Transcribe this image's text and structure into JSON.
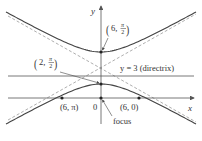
{
  "diagram": {
    "type": "conic-hyperbola-polar",
    "axes": {
      "x_label": "x",
      "y_label": "y",
      "origin_label": "0"
    },
    "labels": {
      "upper_vertex": "(6, π/2)",
      "lower_vertex": "(2, π/2)",
      "left_intercept": "(6, π)",
      "right_intercept": "(6, 0)",
      "directrix": "y = 3 (directrix)",
      "focus": "focus"
    },
    "fractions": {
      "pi": "π",
      "two": "2"
    },
    "points": [
      {
        "name": "upper-vertex",
        "polar": "(6, π/2)"
      },
      {
        "name": "lower-vertex",
        "polar": "(2, π/2)"
      },
      {
        "name": "left-intercept",
        "polar": "(6, π)"
      },
      {
        "name": "right-intercept",
        "polar": "(6, 0)"
      },
      {
        "name": "focus",
        "polar": "origin"
      }
    ],
    "colors": {
      "curve": "#444444",
      "axis": "#555555",
      "asymptote": "#9a9a9a",
      "text": "#333333"
    }
  }
}
